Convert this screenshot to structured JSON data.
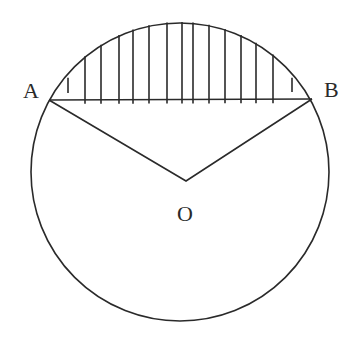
{
  "diagram": {
    "type": "circle-segment",
    "stroke_color": "#2a2a2a",
    "background": "#ffffff",
    "circle": {
      "cx": 180,
      "cy": 172,
      "r": 149
    },
    "points": {
      "A": {
        "label": "A",
        "x": 49,
        "y": 100
      },
      "B": {
        "label": "B",
        "x": 312,
        "y": 99
      },
      "O": {
        "label": "O",
        "x": 186,
        "y": 181
      }
    },
    "labels": {
      "A": "A",
      "B": "B",
      "O": "O"
    },
    "hatch_x": [
      68,
      85,
      101,
      119,
      133,
      149,
      167,
      182,
      193,
      209,
      225,
      241,
      256,
      273,
      292
    ]
  }
}
